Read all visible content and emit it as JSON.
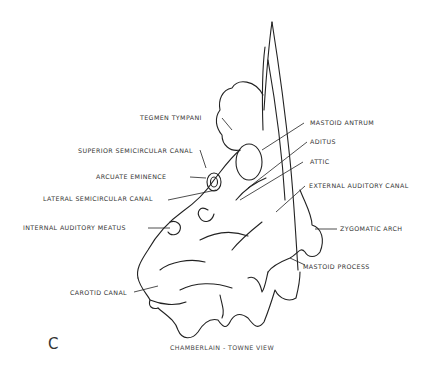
{
  "figure": {
    "panel_letter": "C",
    "caption": "CHAMBERLAIN - TOWNE VIEW",
    "labels": [
      {
        "id": "tegmen_tympani",
        "text": "TEGMEN TYMPANI"
      },
      {
        "id": "mastoid_antrum",
        "text": "MASTOID ANTRUM"
      },
      {
        "id": "aditus",
        "text": "ADITUS"
      },
      {
        "id": "superior_semicircular_canal",
        "text": "SUPERIOR SEMICIRCULAR CANAL"
      },
      {
        "id": "attic",
        "text": "ATTIC"
      },
      {
        "id": "arcuate_eminence",
        "text": "ARCUATE EMINENCE"
      },
      {
        "id": "external_auditory_canal",
        "text": "EXTERNAL AUDITORY CANAL"
      },
      {
        "id": "lateral_semicircular_canal",
        "text": "LATERAL SEMICIRCULAR CANAL"
      },
      {
        "id": "zygomatic_arch",
        "text": "ZYGOMATIC ARCH"
      },
      {
        "id": "internal_auditory_meatus",
        "text": "INTERNAL AUDITORY MEATUS"
      },
      {
        "id": "mastoid_process",
        "text": "MASTOID PROCESS"
      },
      {
        "id": "carotid_canal",
        "text": "CAROTID CANAL"
      }
    ]
  }
}
